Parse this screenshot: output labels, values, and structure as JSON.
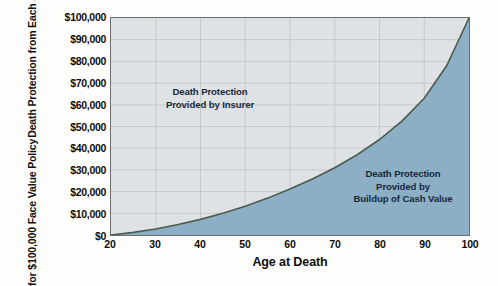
{
  "chart_data": {
    "type": "area",
    "title": "",
    "xlabel": "Age at Death",
    "ylabel_line1": "Death Protection from Each Source",
    "ylabel_line2": "for $100,000 Face Value Policy",
    "xlim": [
      20,
      100
    ],
    "ylim": [
      0,
      100000
    ],
    "grid": true,
    "legend_position": "inside-annotations",
    "xticks": [
      20,
      30,
      40,
      50,
      60,
      70,
      80,
      90,
      100
    ],
    "xtick_labels": [
      "20",
      "30",
      "40",
      "50",
      "60",
      "70",
      "80",
      "90",
      "100"
    ],
    "yticks": [
      0,
      10000,
      20000,
      30000,
      40000,
      50000,
      60000,
      70000,
      80000,
      90000,
      100000
    ],
    "ytick_labels": [
      "$0",
      "$10,000",
      "$20,000",
      "$30,000",
      "$40,000",
      "$50,000",
      "$60,000",
      "$70,000",
      "$80,000",
      "$90,000",
      "$100,000"
    ],
    "series": [
      {
        "name": "Buildup of Cash Value",
        "fill_color": "#8cafc6",
        "line_color": "#4b5c4e",
        "x": [
          20,
          25,
          30,
          35,
          40,
          45,
          50,
          55,
          60,
          65,
          70,
          75,
          80,
          85,
          90,
          95,
          100
        ],
        "values": [
          0,
          1200,
          2800,
          4800,
          7200,
          10000,
          13300,
          17000,
          21200,
          25800,
          31000,
          37000,
          44000,
          52500,
          63000,
          78000,
          100000
        ]
      },
      {
        "name": "Provided by Insurer",
        "fill_color": "#dfe2e4",
        "x": [
          20,
          25,
          30,
          35,
          40,
          45,
          50,
          55,
          60,
          65,
          70,
          75,
          80,
          85,
          90,
          95,
          100
        ],
        "values": [
          100000,
          98800,
          97200,
          95200,
          92800,
          90000,
          86700,
          83000,
          78800,
          74200,
          69000,
          63000,
          56000,
          47500,
          37000,
          22000,
          0
        ]
      }
    ],
    "annotations": [
      {
        "name": "insurer-label",
        "lines": [
          "Death Protection",
          "Provided by Insurer"
        ]
      },
      {
        "name": "cash-value-label",
        "lines": [
          "Death Protection",
          "Provided by",
          "Buildup of Cash Value"
        ]
      }
    ],
    "colors": {
      "plot_background": "#dfe2e4",
      "cash_value_fill": "#8cafc6",
      "curve_line": "#4b5c4e",
      "grid": "#b9bdc0",
      "axis_border": "#6d6d6d",
      "text": "#0d0d0d",
      "annotation_text": "#18283a"
    }
  }
}
